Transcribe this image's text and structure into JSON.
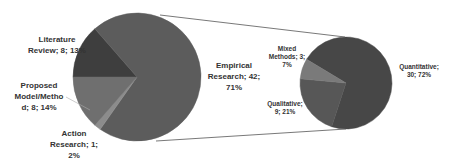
{
  "chart_data": {
    "type": "pie",
    "subtype": "pie-of-pie",
    "title": "",
    "series": [
      {
        "name": "Research Type",
        "categories": [
          "Empirical Research",
          "Literature Review",
          "Proposed Model/Method",
          "Action Research"
        ],
        "values": [
          42,
          8,
          8,
          1
        ],
        "percentages": [
          71,
          13,
          14,
          2
        ],
        "colors": [
          "#5c5c5c",
          "#3e3e3e",
          "#6f6f6f",
          "#8c8c8c"
        ]
      },
      {
        "name": "Empirical Research Breakdown",
        "categories": [
          "Quantitative",
          "Qualitative",
          "Mixed Methods"
        ],
        "values": [
          30,
          9,
          3
        ],
        "percentages": [
          72,
          21,
          7
        ],
        "colors": [
          "#474747",
          "#575757",
          "#7a7a7a"
        ]
      }
    ]
  },
  "labels": {
    "literature_1": "Literature",
    "literature_2": "Review; 8; 13%",
    "proposed_1": "Proposed",
    "proposed_2": "Model/Metho",
    "proposed_3": "d; 8; 14%",
    "action_1": "Action",
    "action_2": "Research; 1;",
    "action_3": "2%",
    "empirical_1": "Empirical",
    "empirical_2": "Research; 42;",
    "empirical_3": "71%",
    "mixed_1": "Mixed",
    "mixed_2": "Methods; 3;",
    "mixed_3": "7%",
    "qualitative_1": "Qualitative;",
    "qualitative_2": "9; 21%",
    "quantitative_1": "Quantitative;",
    "quantitative_2": "30; 72%"
  }
}
